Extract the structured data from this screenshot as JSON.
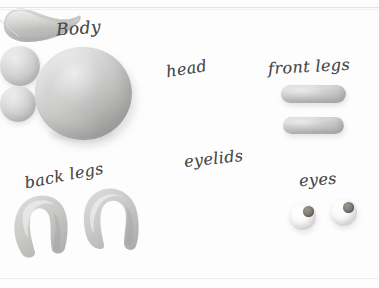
{
  "scene": {
    "title": "Clay model parts layout",
    "background_color": "#fdfdfd",
    "clay_color": "#c6c7c5",
    "eye_white_color": "#fbfbfb",
    "pupil_color": "#85817a",
    "label_ink_color": "#4a4a4a"
  },
  "labels": {
    "body": "Body",
    "head": "head",
    "front_legs": "front legs",
    "back_legs": "back legs",
    "eyelids": "eyelids",
    "eyes": "eyes"
  },
  "parts": [
    {
      "name": "body",
      "label": "Body",
      "shape": "sphere",
      "count": 1
    },
    {
      "name": "head",
      "label": "head",
      "shape": "curved-cylinder",
      "count": 1
    },
    {
      "name": "front-legs",
      "label": "front legs",
      "shape": "capsule",
      "count": 2
    },
    {
      "name": "back-legs",
      "label": "back legs",
      "shape": "horseshoe",
      "count": 2
    },
    {
      "name": "eyelids",
      "label": "eyelids",
      "shape": "disc",
      "count": 2
    },
    {
      "name": "eyes",
      "label": "eyes",
      "shape": "sphere-with-pupil",
      "count": 2
    }
  ]
}
